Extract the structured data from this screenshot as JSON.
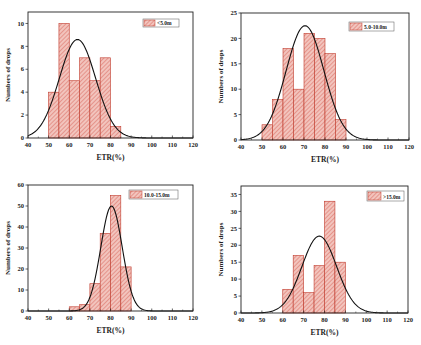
{
  "colors": {
    "bar_fill": "#f2c4bd",
    "bar_hatch": "#d9655a",
    "bar_edge": "#c0392b",
    "curve": "#111111",
    "axis": "#222222"
  },
  "chart_data": [
    {
      "type": "bar",
      "title": "",
      "legend": "<5.0m",
      "xlabel": "ETR(%)",
      "ylabel": "Numbers of drops",
      "bin_edges": [
        50,
        55,
        60,
        65,
        70,
        75,
        80,
        85
      ],
      "values": [
        4,
        10,
        5,
        7,
        5,
        7,
        1
      ],
      "xlim": [
        40,
        120
      ],
      "ylim": [
        0,
        11
      ],
      "xticks": [
        40,
        50,
        60,
        70,
        80,
        90,
        100,
        110,
        120
      ],
      "yticks": [
        0,
        2,
        4,
        6,
        8,
        10
      ],
      "fit_curve": {
        "type": "normal",
        "peak": 8.6,
        "mean": 64,
        "sigma": 8.8
      },
      "legend_position": "upper right",
      "grid": false
    },
    {
      "type": "bar",
      "title": "",
      "legend": "5.0-10.0m",
      "xlabel": "ETR(%)",
      "ylabel": "Numbers of drops",
      "bin_edges": [
        50,
        55,
        60,
        65,
        70,
        75,
        80,
        85,
        90
      ],
      "values": [
        3,
        8,
        18,
        10,
        21,
        20,
        17,
        4
      ],
      "xlim": [
        40,
        120
      ],
      "ylim": [
        0,
        25
      ],
      "xticks": [
        40,
        50,
        60,
        70,
        80,
        90,
        100,
        110,
        120
      ],
      "yticks": [
        0,
        5,
        10,
        15,
        20,
        25
      ],
      "fit_curve": {
        "type": "normal",
        "peak": 22.5,
        "mean": 70.5,
        "sigma": 9
      },
      "legend_position": "upper right",
      "grid": false
    },
    {
      "type": "bar",
      "title": "",
      "legend": "10.0-15.0m",
      "xlabel": "ETR(%)",
      "ylabel": "Numbers of drops",
      "bin_edges": [
        60,
        65,
        70,
        75,
        80,
        85,
        90
      ],
      "values": [
        2,
        3,
        13,
        37,
        55,
        21
      ],
      "xlim": [
        40,
        120
      ],
      "ylim": [
        0,
        60
      ],
      "xticks": [
        40,
        50,
        60,
        70,
        80,
        90,
        100,
        110,
        120
      ],
      "yticks": [
        0,
        10,
        20,
        30,
        40,
        50,
        60
      ],
      "fit_curve": {
        "type": "normal",
        "peak": 50,
        "mean": 80.5,
        "sigma": 5.2
      },
      "legend_position": "upper right",
      "grid": false
    },
    {
      "type": "bar",
      "title": "",
      "legend": ">15.0m",
      "xlabel": "ETR(%)",
      "ylabel": "Numbers of drops",
      "bin_edges": [
        60,
        65,
        70,
        75,
        80,
        85,
        90
      ],
      "values": [
        7,
        17,
        6,
        14,
        33,
        15
      ],
      "xlim": [
        40,
        120
      ],
      "ylim": [
        0,
        37.5
      ],
      "xticks": [
        40,
        50,
        60,
        70,
        80,
        90,
        100,
        110,
        120
      ],
      "yticks": [
        0,
        5,
        10,
        15,
        20,
        25,
        30,
        35
      ],
      "fit_curve": {
        "type": "normal",
        "peak": 22.7,
        "mean": 77.5,
        "sigma": 8.3
      },
      "legend_position": "upper right",
      "grid": false
    }
  ],
  "layout": [
    {
      "left": 28,
      "top": 12,
      "right": 193,
      "bottom": 138,
      "legend": {
        "x": 143,
        "y": 19,
        "w": 36,
        "h": 8
      }
    },
    {
      "left": 241,
      "top": 13,
      "right": 409,
      "bottom": 140,
      "legend": {
        "x": 349,
        "y": 22,
        "w": 45,
        "h": 9
      }
    },
    {
      "left": 28,
      "top": 185,
      "right": 193,
      "bottom": 311,
      "legend": {
        "x": 129,
        "y": 190,
        "w": 49,
        "h": 9
      }
    },
    {
      "left": 241,
      "top": 186,
      "right": 408,
      "bottom": 313,
      "legend": {
        "x": 367,
        "y": 191,
        "w": 37,
        "h": 10
      }
    }
  ]
}
